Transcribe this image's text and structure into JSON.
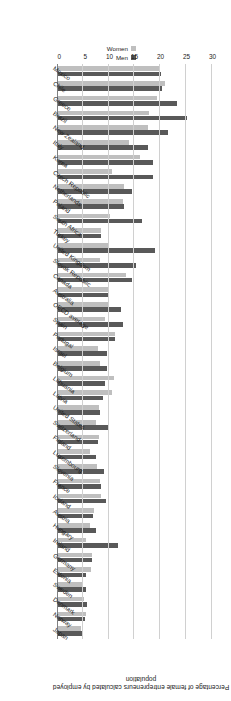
{
  "chart_data": {
    "type": "bar",
    "orientation": "horizontal",
    "title": "",
    "xlabel": "Percentage of female entrepreneurs calculated by employed population",
    "ylabel": "",
    "xlim": [
      0,
      30
    ],
    "xticks": [
      0,
      5,
      10,
      15,
      20,
      25,
      30
    ],
    "grid": true,
    "legend_position": "top-right",
    "colors": {
      "men": "#595959",
      "women": "#bfbfbf",
      "gridline": "#d0d0d0",
      "axis": "#808080"
    },
    "categories": [
      "Mexico",
      "Chile",
      "Greece",
      "Brazil",
      "New Zealand",
      "Italy",
      "Korea",
      "Czech Republic",
      "Netherlands",
      "Poland",
      "South Africa",
      "Turkey",
      "United Kingdom",
      "Slovak Republic",
      "Canada",
      "Australia",
      "OECD average",
      "Spain",
      "Portugal",
      "Israel",
      "Belgium",
      "Lithuania",
      "Latvia",
      "United States",
      "Switzerland",
      "Finland",
      "Luxembourg",
      "Slovenia",
      "France",
      "Iceland",
      "Austria",
      "Hungary",
      "Ireland",
      "Germany",
      "Estonia",
      "Sweden",
      "Denmark",
      "Norway",
      "Japan"
    ],
    "series": [
      {
        "name": "Men",
        "color": "#595959",
        "values": [
          20.1,
          20.4,
          23.3,
          25.1,
          21.4,
          17.6,
          18.6,
          18.5,
          14.6,
          13.0,
          16.4,
          8.6,
          18.9,
          15.2,
          14.5,
          10.1,
          12.3,
          12.7,
          11.2,
          9.7,
          9.6,
          9.3,
          8.9,
          8.3,
          9.8,
          8.0,
          7.6,
          9.1,
          8.5,
          9.4,
          7.0,
          7.6,
          11.9,
          6.8,
          5.7,
          5.7,
          5.9,
          5.4,
          5.1
        ]
      },
      {
        "name": "Women",
        "color": "#bfbfbf",
        "values": [
          20.0,
          20.9,
          19.3,
          17.9,
          17.6,
          13.9,
          16.1,
          10.7,
          13.0,
          12.8,
          10.3,
          8.6,
          10.0,
          8.4,
          13.3,
          10.1,
          9.8,
          9.2,
          11.3,
          7.9,
          8.3,
          11.1,
          10.6,
          8.2,
          7.5,
          8.2,
          6.4,
          7.8,
          8.4,
          8.5,
          7.2,
          6.4,
          5.6,
          6.7,
          6.6,
          5.1,
          5.2,
          5.6,
          4.6
        ]
      }
    ]
  },
  "legend": {
    "items": [
      {
        "label": "Men",
        "color": "#595959"
      },
      {
        "label": "Women",
        "color": "#bfbfbf"
      }
    ]
  },
  "axis": {
    "title": "Percentage of female entrepreneurs calculated by employed population",
    "tick_labels": [
      "30",
      "25",
      "20",
      "15",
      "10",
      "5",
      "0"
    ]
  }
}
